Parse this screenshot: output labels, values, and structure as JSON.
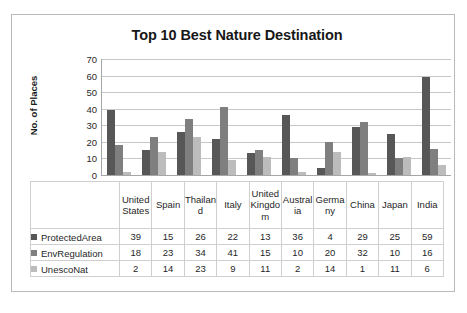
{
  "chart_data": {
    "type": "bar",
    "title": "Top 10 Best Nature Destination",
    "xlabel": "",
    "ylabel": "No. of Places",
    "ylim": [
      0,
      70
    ],
    "ytick_step": 10,
    "yticks": [
      "70",
      "60",
      "50",
      "40",
      "30",
      "20",
      "10",
      "0"
    ],
    "grid": true,
    "legend_position": "table-left",
    "categories": [
      "United States",
      "Spain",
      "Thailand",
      "Italy",
      "United Kingdom",
      "Australia",
      "Germany",
      "China",
      "Japan",
      "India"
    ],
    "series": [
      {
        "name": "ProtectedArea",
        "color": "#575757",
        "values": [
          39,
          15,
          26,
          22,
          13,
          36,
          4,
          29,
          25,
          59
        ]
      },
      {
        "name": "EnvRegulation",
        "color": "#7f7f7f",
        "values": [
          18,
          23,
          34,
          41,
          15,
          10,
          20,
          32,
          10,
          16
        ]
      },
      {
        "name": "UnescoNat",
        "color": "#bcbcbc",
        "values": [
          2,
          14,
          23,
          9,
          11,
          2,
          14,
          1,
          11,
          6
        ]
      }
    ]
  },
  "table": {
    "legend_blank": ""
  }
}
